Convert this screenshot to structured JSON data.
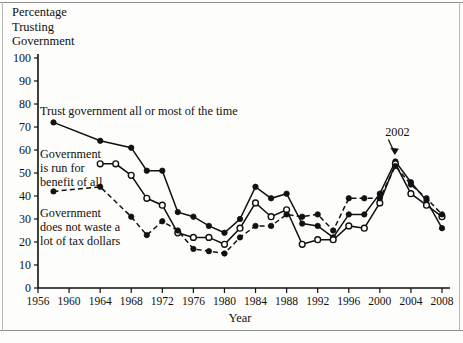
{
  "figure": {
    "ylabel_lines": [
      "Percentage",
      "Trusting",
      "Government"
    ],
    "xlabel": "Year"
  },
  "annotations": [
    {
      "text": "2002",
      "x": 2002,
      "y": 55
    }
  ],
  "series_labels": {
    "trust": "Trust government all or most of the time",
    "benefit_line1": "Government",
    "benefit_line2": "is run for",
    "benefit_line3": "benefit of all",
    "waste_line1": "Government",
    "waste_line2": "does not waste a",
    "waste_line3": "lot of tax dollars"
  },
  "chart_data": {
    "type": "line",
    "title": "",
    "xlabel": "Year",
    "ylabel": "Percentage Trusting Government",
    "xlim": [
      1956,
      2008
    ],
    "ylim": [
      0,
      100
    ],
    "ytick_labels": [
      "0",
      "10",
      "20",
      "30",
      "40",
      "50",
      "60",
      "70",
      "80",
      "90",
      "100"
    ],
    "yticks": [
      0,
      10,
      20,
      30,
      40,
      50,
      60,
      70,
      80,
      90,
      100
    ],
    "xticks": [
      1956,
      1960,
      1964,
      1968,
      1972,
      1976,
      1980,
      1984,
      1988,
      1992,
      1996,
      2000,
      2004,
      2008
    ],
    "xtick_labels": [
      "1956",
      "1960",
      "1964",
      "1968",
      "1972",
      "1976",
      "1980",
      "1984",
      "1988",
      "1992",
      "1996",
      "2000",
      "2004",
      "2008"
    ],
    "grid": false,
    "legend": "inline-annotations",
    "series": [
      {
        "name": "Trust government all or most of the time",
        "style": "solid",
        "marker": "filled-circle",
        "x": [
          1958,
          1964,
          1968,
          1970,
          1972,
          1974,
          1976,
          1978,
          1980,
          1982,
          1984,
          1986,
          1988,
          1990,
          1992,
          1994,
          1996,
          1998,
          2000,
          2002,
          2004,
          2006,
          2008
        ],
        "y": [
          72,
          64,
          61,
          51,
          51,
          33,
          31,
          27,
          24,
          30,
          44,
          39,
          41,
          28,
          27,
          22,
          32,
          32,
          41,
          55,
          46,
          38,
          26
        ]
      },
      {
        "name": "Government is run for benefit of all",
        "style": "solid",
        "marker": "open-circle",
        "x": [
          1964,
          1966,
          1968,
          1970,
          1972,
          1974,
          1976,
          1978,
          1980,
          1982,
          1984,
          1986,
          1988,
          1990,
          1992,
          1994,
          1996,
          1998,
          2000,
          2002,
          2004,
          2006,
          2008
        ],
        "y": [
          54,
          54,
          49,
          39,
          36,
          24,
          22,
          22,
          19,
          26,
          37,
          31,
          34,
          19,
          21,
          21,
          27,
          26,
          37,
          54,
          41,
          36,
          31
        ]
      },
      {
        "name": "Government does not waste a lot of tax dollars",
        "style": "dashed",
        "marker": "filled-circle",
        "x": [
          1958,
          1964,
          1968,
          1970,
          1972,
          1974,
          1976,
          1978,
          1980,
          1982,
          1984,
          1986,
          1988,
          1990,
          1992,
          1994,
          1996,
          1998,
          2000,
          2002,
          2004,
          2006,
          2008
        ],
        "y": [
          42,
          44,
          31,
          23,
          29,
          25,
          17,
          16,
          15,
          22,
          27,
          27,
          32,
          31,
          32,
          25,
          39,
          39,
          39,
          53,
          45,
          39,
          32
        ]
      }
    ]
  }
}
